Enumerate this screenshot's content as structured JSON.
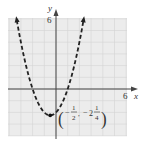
{
  "chart_data": {
    "type": "line",
    "title": "",
    "xlabel": "x",
    "ylabel": "y",
    "function": "y = (x + 1/2)^2 - 9/4",
    "line_style": "dashed",
    "xlim": [
      -4,
      6
    ],
    "ylim": [
      -4,
      6
    ],
    "x_tick_labels": [
      "6"
    ],
    "y_tick_labels": [
      "6"
    ],
    "grid": true,
    "vertex": {
      "x": -0.5,
      "y": -2.25,
      "label": "(-1/2, -2 1/4)"
    },
    "x_intercepts": [
      -2,
      1
    ],
    "y_intercept": -2,
    "series": [
      {
        "name": "parabola",
        "x": [
          -3.4,
          -3,
          -2.5,
          -2,
          -1.5,
          -1,
          -0.5,
          0,
          0.5,
          1,
          1.5,
          2,
          2.4
        ],
        "y": [
          6.16,
          4,
          2,
          0,
          -1.25,
          -2,
          -2.25,
          -2,
          -1.25,
          0,
          2,
          4,
          6.16
        ]
      }
    ]
  },
  "labels": {
    "x_axis": "x",
    "y_axis": "y",
    "x_max_tick": "6",
    "y_max_tick": "6",
    "vertex_x_num": "1",
    "vertex_x_den": "2",
    "vertex_y_whole": "2",
    "vertex_y_num": "1",
    "vertex_y_den": "4"
  },
  "colors": {
    "grid_bg": "#ececec",
    "grid_line": "#d2d2d2",
    "axis": "#444444",
    "curve": "#222222"
  }
}
